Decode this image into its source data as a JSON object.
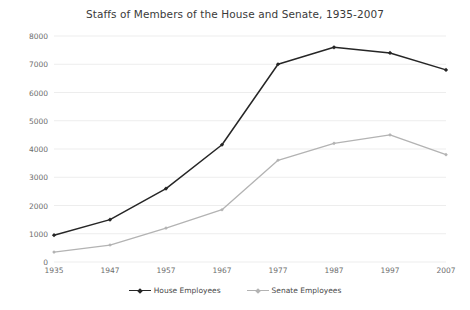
{
  "chart_data": {
    "type": "line",
    "title": "Staffs of Members of the House and Senate, 1935-2007",
    "xlabel": "",
    "ylabel": "",
    "categories": [
      "1935",
      "1947",
      "1957",
      "1967",
      "1977",
      "1987",
      "1997",
      "2007"
    ],
    "series": [
      {
        "name": "House Employees",
        "color": "#262626",
        "marker": "diamond",
        "values": [
          950,
          1500,
          2600,
          4150,
          7000,
          7600,
          7400,
          6800
        ]
      },
      {
        "name": "Senate Employees",
        "color": "#b3b3b3",
        "marker": "diamond",
        "values": [
          350,
          600,
          1200,
          1850,
          3600,
          4200,
          4500,
          3800
        ]
      }
    ],
    "ylim": [
      0,
      8000
    ],
    "ytick_values": [
      0,
      1000,
      2000,
      3000,
      4000,
      5000,
      6000,
      7000,
      8000
    ],
    "ytick_labels": [
      "0",
      "1000",
      "2000",
      "3000",
      "4000",
      "5000",
      "6000",
      "7000",
      "8000"
    ],
    "grid": true,
    "grid_axis": "y",
    "grid_color": "#ededed",
    "legend_position": "bottom",
    "legend": [
      "House Employees",
      "Senate Employees"
    ],
    "background": "#ffffff",
    "tick_color": "#6d6d6d",
    "title_color": "#3a3a3a"
  }
}
